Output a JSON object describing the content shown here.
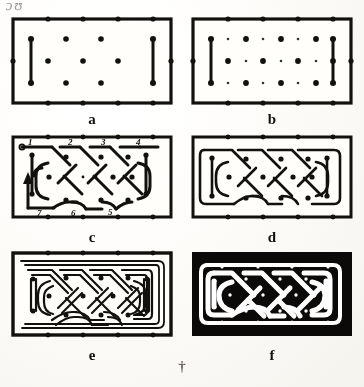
{
  "figure": {
    "kind": "celtic-knot-construction-plate",
    "stray_mark_top_left": "ɔ ʊ",
    "bottom_mark": "†",
    "panel_count": 6
  },
  "panels": [
    {
      "id": "a",
      "caption": "a",
      "description": "Bordered rectangle with dot lattice and two vertical end bars",
      "row": 1,
      "col": 1,
      "lattice": "sparse",
      "end_bars": 2
    },
    {
      "id": "b",
      "caption": "b",
      "description": "Bordered rectangle with dense alternating dot lattice and two vertical end bars",
      "row": 1,
      "col": 2,
      "lattice": "dense",
      "end_bars": 2
    },
    {
      "id": "c",
      "caption": "c",
      "description": "Single-line knot path drawn over the dot grid with numbered construction steps and a direction arrow",
      "row": 2,
      "col": 1,
      "step_labels_top": [
        "1",
        "2",
        "3",
        "4"
      ],
      "step_labels_bottom": [
        "7",
        "6",
        "5"
      ],
      "start_marker": "o",
      "arrow": "up"
    },
    {
      "id": "d",
      "caption": "d",
      "description": "Completed closed single-line knot path",
      "row": 2,
      "col": 2
    },
    {
      "id": "e",
      "caption": "e",
      "description": "Knot redrawn as outlined double-line ribbons over the dot grid",
      "row": 3,
      "col": 1
    },
    {
      "id": "f",
      "caption": "f",
      "description": "Finished interlace: black ground with white ribbon bands and white dots",
      "row": 3,
      "col": 2
    }
  ],
  "colors": {
    "ink": "#141210",
    "paper": "#faf8f4",
    "band": "#ffffff",
    "ground": "#0d0c0a"
  }
}
